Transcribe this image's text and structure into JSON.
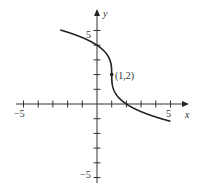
{
  "chart_data": {
    "type": "line",
    "title": "",
    "xlabel": "x",
    "ylabel": "y",
    "xlim": [
      -5,
      5
    ],
    "ylim": [
      -5,
      5
    ],
    "x_ticks": [
      -5,
      -4,
      -3,
      -2,
      -1,
      1,
      2,
      3,
      4,
      5
    ],
    "y_ticks": [
      -5,
      -4,
      -3,
      -2,
      -1,
      1,
      2,
      3,
      4,
      5
    ],
    "x_tick_labels_shown": {
      "-5": "−5",
      "5": "5"
    },
    "y_tick_labels_shown": {
      "5": "5",
      "-5": "−5"
    },
    "grid": false,
    "series": [
      {
        "name": "curve",
        "function": "y = 2 - 2*cbrt(x - 1)",
        "x_range": [
          -2.5,
          5
        ],
        "points": [
          [
            -2.5,
            5.04
          ],
          [
            -2,
            4.88
          ],
          [
            -1,
            4.52
          ],
          [
            0,
            4.0
          ],
          [
            0.5,
            3.59
          ],
          [
            0.9,
            2.93
          ],
          [
            1,
            2
          ],
          [
            1.1,
            1.07
          ],
          [
            1.5,
            0.41
          ],
          [
            2,
            0
          ],
          [
            3,
            -0.52
          ],
          [
            4,
            -0.88
          ],
          [
            5,
            -1.17
          ]
        ]
      }
    ],
    "annotations": [
      {
        "text": "(1,2)",
        "x": 1,
        "y": 2,
        "marker": "dot"
      }
    ]
  },
  "labels": {
    "x_axis": "x",
    "y_axis": "y",
    "x_min": "−5",
    "x_max": "5",
    "y_max": "5",
    "y_min": "−5",
    "point": "(1,2)"
  }
}
